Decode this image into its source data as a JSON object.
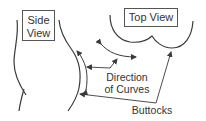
{
  "diagram": {
    "labels": {
      "side_view": {
        "line1": "Side",
        "line2": "View"
      },
      "top_view": "Top View",
      "direction_of_curves": {
        "line1": "Direction",
        "line2": "of Curves"
      },
      "buttocks": "Buttocks"
    },
    "colors": {
      "stroke": "#3a3a3a",
      "text": "#333333",
      "background": "#ffffff",
      "box_border": "#555555"
    }
  }
}
